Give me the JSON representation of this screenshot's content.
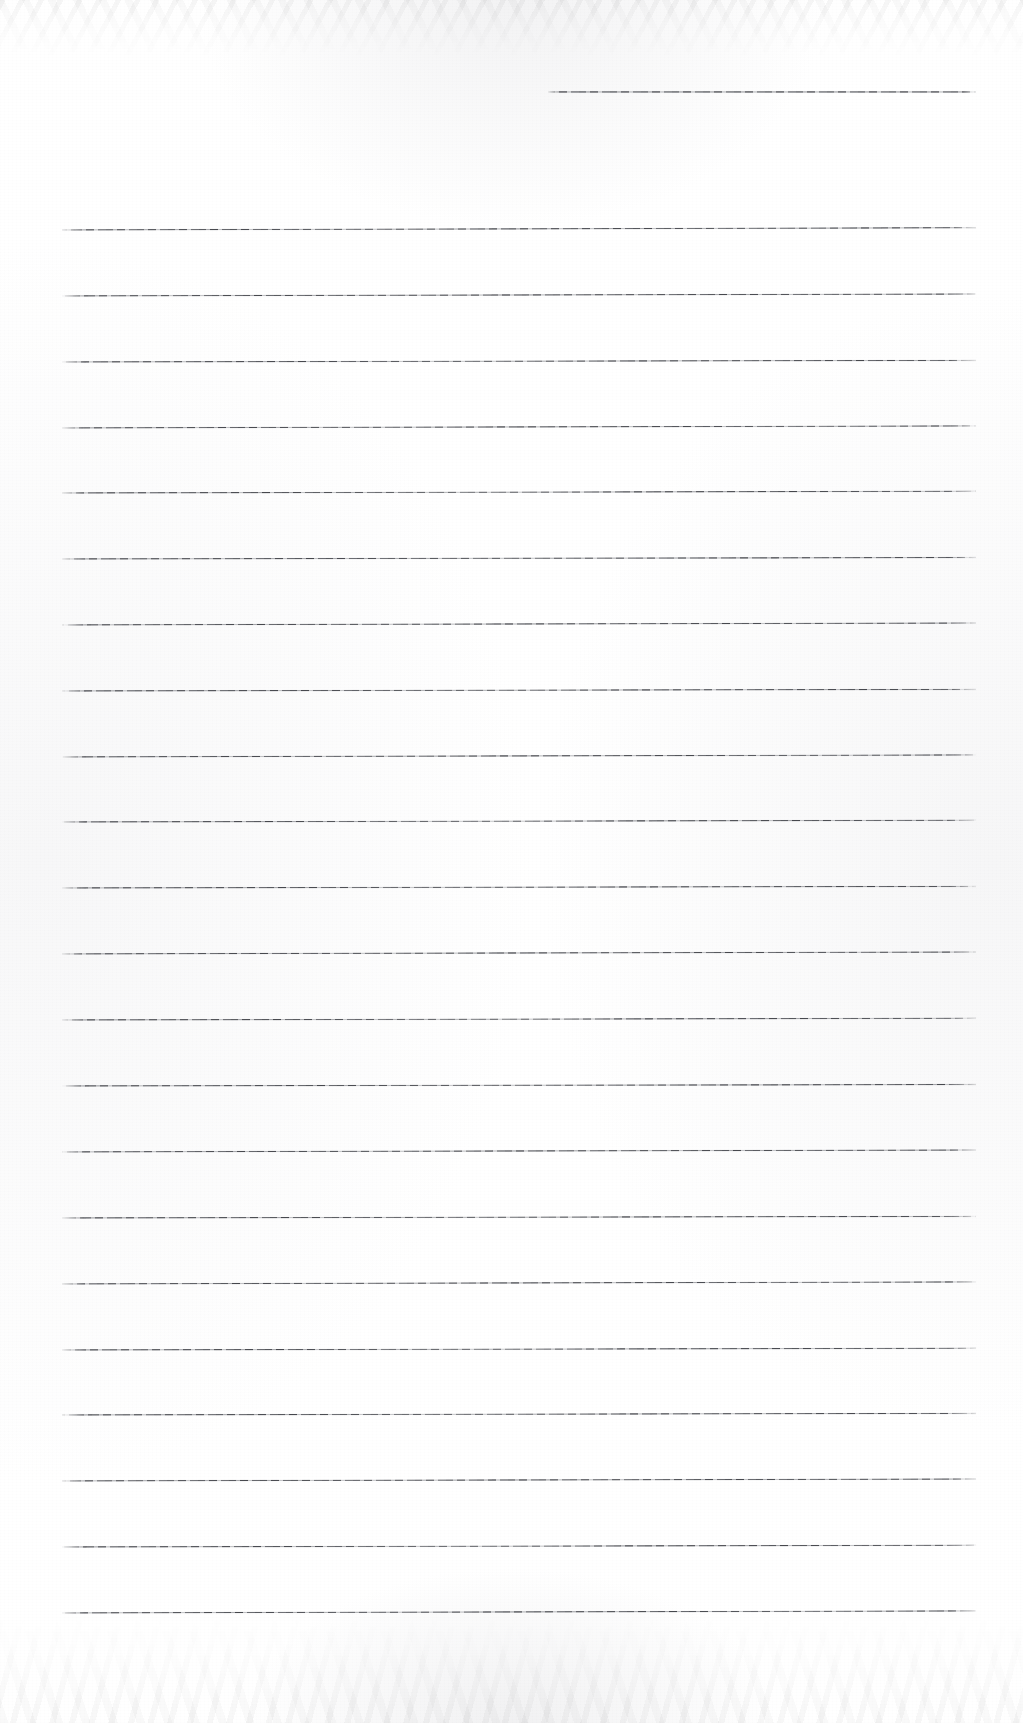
{
  "document": {
    "kind": "scanned-ruled-notepad-page",
    "title": "Blank Ruled Notepad Page",
    "page_width": 1023,
    "page_height": 1723,
    "background_color": "#ffffff",
    "rule_color": "#4a4c52",
    "body_text": "",
    "handwriting": "",
    "printed_text": "",
    "visible_text_count": 0
  },
  "ruling": {
    "full_rule_count": 22,
    "partial_rule_count": 1,
    "left_margin_x": 62,
    "right_margin_x": 976,
    "line_spacing_px": 66,
    "first_full_rule_y": 230,
    "last_full_rule_y": 1613,
    "stroke_thickness_px": 1.5,
    "partial_rule": {
      "label": "top-right short rule",
      "x_start": 548,
      "x_end": 976,
      "y": 92
    },
    "full_rules": [
      {
        "y": 230,
        "x_start": 62,
        "x_end": 976,
        "tilt_deg": -0.14
      },
      {
        "y": 296,
        "x_start": 62,
        "x_end": 976,
        "tilt_deg": -0.12
      },
      {
        "y": 362,
        "x_start": 62,
        "x_end": 976,
        "tilt_deg": -0.1
      },
      {
        "y": 428,
        "x_start": 62,
        "x_end": 976,
        "tilt_deg": -0.13
      },
      {
        "y": 493,
        "x_start": 62,
        "x_end": 976,
        "tilt_deg": -0.11
      },
      {
        "y": 559,
        "x_start": 62,
        "x_end": 976,
        "tilt_deg": -0.09
      },
      {
        "y": 625,
        "x_start": 62,
        "x_end": 976,
        "tilt_deg": -0.12
      },
      {
        "y": 691,
        "x_start": 62,
        "x_end": 976,
        "tilt_deg": -0.1
      },
      {
        "y": 757,
        "x_start": 62,
        "x_end": 976,
        "tilt_deg": -0.13
      },
      {
        "y": 822,
        "x_start": 62,
        "x_end": 976,
        "tilt_deg": -0.11
      },
      {
        "y": 888,
        "x_start": 62,
        "x_end": 976,
        "tilt_deg": -0.1
      },
      {
        "y": 954,
        "x_start": 62,
        "x_end": 976,
        "tilt_deg": -0.12
      },
      {
        "y": 1020,
        "x_start": 62,
        "x_end": 976,
        "tilt_deg": -0.11
      },
      {
        "y": 1086,
        "x_start": 62,
        "x_end": 976,
        "tilt_deg": -0.09
      },
      {
        "y": 1152,
        "x_start": 62,
        "x_end": 976,
        "tilt_deg": -0.12
      },
      {
        "y": 1218,
        "x_start": 62,
        "x_end": 976,
        "tilt_deg": -0.1
      },
      {
        "y": 1284,
        "x_start": 62,
        "x_end": 976,
        "tilt_deg": -0.13
      },
      {
        "y": 1350,
        "x_start": 62,
        "x_end": 976,
        "tilt_deg": -0.11
      },
      {
        "y": 1415,
        "x_start": 62,
        "x_end": 976,
        "tilt_deg": -0.1
      },
      {
        "y": 1481,
        "x_start": 62,
        "x_end": 976,
        "tilt_deg": -0.12
      },
      {
        "y": 1547,
        "x_start": 62,
        "x_end": 976,
        "tilt_deg": -0.11
      },
      {
        "y": 1613,
        "x_start": 62,
        "x_end": 976,
        "tilt_deg": -0.13
      }
    ]
  },
  "scan_artifacts": {
    "top_edge_mottle": true,
    "bottom_edge_mottle": true,
    "paper_grain": true,
    "edge_vignette": true
  }
}
